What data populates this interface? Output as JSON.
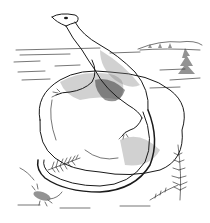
{
  "illustration": {
    "style": "black-and-white pen-and-ink stipple drawing",
    "subject": "lizard-like reptile resting on a boulder",
    "elements": [
      {
        "name": "reptile",
        "description": "long-necked lizard-like reptile with long curled tail, head raised"
      },
      {
        "name": "boulder",
        "description": "large rounded rock with stipple shading"
      },
      {
        "name": "horizon",
        "description": "flat plain with distant hills"
      },
      {
        "name": "trees",
        "description": "small conifers on right hill"
      },
      {
        "name": "ferns",
        "description": "fern fronds at lower left and lower right"
      },
      {
        "name": "insect",
        "description": "small arthropod at lower left"
      }
    ],
    "colors": {
      "ink": "#1a1a1a",
      "paper": "#ffffff"
    }
  }
}
